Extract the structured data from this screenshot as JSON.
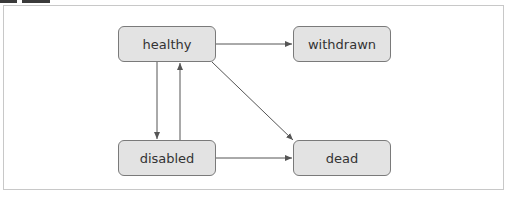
{
  "diagram": {
    "type": "state-diagram",
    "nodes": [
      {
        "id": "healthy",
        "label": "healthy"
      },
      {
        "id": "withdrawn",
        "label": "withdrawn"
      },
      {
        "id": "disabled",
        "label": "disabled"
      },
      {
        "id": "dead",
        "label": "dead"
      }
    ],
    "edges": [
      {
        "from": "healthy",
        "to": "withdrawn"
      },
      {
        "from": "healthy",
        "to": "disabled"
      },
      {
        "from": "disabled",
        "to": "healthy"
      },
      {
        "from": "healthy",
        "to": "dead"
      },
      {
        "from": "disabled",
        "to": "dead"
      }
    ],
    "colors": {
      "node_fill": "#e3e3e3",
      "node_border": "#7a7a7a",
      "edge": "#555555",
      "frame_border": "#c8c8c8"
    }
  }
}
